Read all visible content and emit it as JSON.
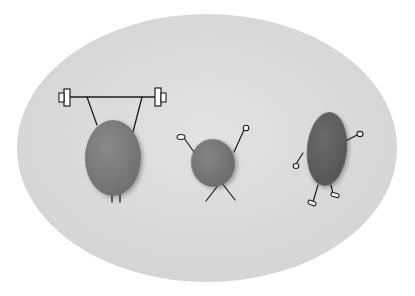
{
  "image": {
    "description": "Three grey pebbles with hand-drawn stick limbs on a light grey oval background",
    "background_color": "#ffffff",
    "oval_color": "#dadada",
    "oval_edge_color": "#d2d2d2",
    "line_color": "#1e1e1e"
  },
  "figures": [
    {
      "name": "weightlifter-pebble",
      "pose": "lifting barbell overhead",
      "color": "#7c7c7c"
    },
    {
      "name": "cheering-pebble",
      "pose": "arms raised, legs crossed",
      "color": "#777777"
    },
    {
      "name": "walking-pebble",
      "pose": "walking with arm raised",
      "color": "#616161"
    }
  ]
}
